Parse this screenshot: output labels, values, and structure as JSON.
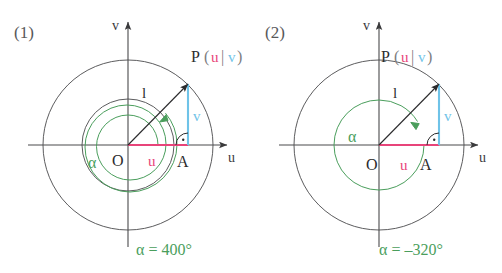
{
  "figure": {
    "colors": {
      "axis": "#4a4a4c",
      "circle": "#4a4a4c",
      "radius": "#2b2b2d",
      "u_component": "#e8447a",
      "v_component": "#6fc3e8",
      "angle_arc": "#4a9e5c",
      "background": "#ffffff"
    },
    "panels": [
      {
        "id": "panel-1",
        "number_label": "(1)",
        "axis_v_label": "v",
        "axis_u_label": "u",
        "origin_label": "O",
        "foot_label": "A",
        "radius_label": "l",
        "angle_label": "α",
        "u_label": "u",
        "v_label": "v",
        "point_label": "P",
        "paren_open": "(",
        "paren_bar": "|",
        "paren_close": ")",
        "point_coord_u": "u",
        "point_coord_v": "v",
        "angle_value": "α = 400°",
        "angle_degrees": 400,
        "angle_direction": "counterclockwise",
        "terminal_angle_degrees": 40,
        "outer_circle_radius": 85,
        "inner_circle_radius": 46
      },
      {
        "id": "panel-2",
        "number_label": "(2)",
        "axis_v_label": "v",
        "axis_u_label": "u",
        "origin_label": "O",
        "foot_label": "A",
        "radius_label": "l",
        "angle_label": "α",
        "u_label": "u",
        "v_label": "v",
        "point_label": "P",
        "paren_open": "(",
        "paren_bar": "|",
        "paren_close": ")",
        "point_coord_u": "u",
        "point_coord_v": "v",
        "angle_value": "α = –320°",
        "angle_degrees": -320,
        "angle_direction": "clockwise",
        "terminal_angle_degrees": 40,
        "outer_circle_radius": 85,
        "inner_circle_radius": 0
      }
    ]
  }
}
